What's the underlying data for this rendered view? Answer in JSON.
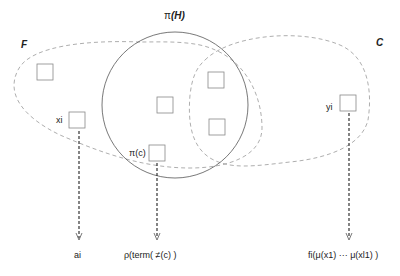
{
  "diagram": {
    "sets": {
      "F": {
        "label": "F"
      },
      "H": {
        "label": "π (H)",
        "label_prefix": "π",
        "label_set": "(H)"
      },
      "C": {
        "label": "C"
      }
    },
    "nodes": {
      "xi": {
        "label": "xi"
      },
      "yi": {
        "label": "yi"
      },
      "pic": {
        "label": "π(c)"
      }
    },
    "outputs": {
      "ai": {
        "label": "ai"
      },
      "rho": {
        "label": "ρ(term( ≠(c) )"
      },
      "fi": {
        "label": "fi(μ(x1) ··· μ(xl1) )"
      }
    },
    "colors": {
      "dashed_region": "#999999",
      "circle": "#555555",
      "box": "#888888",
      "arrow": "#333333"
    }
  }
}
